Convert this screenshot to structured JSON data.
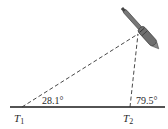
{
  "diagram": {
    "type": "triangulation",
    "ground_line": {
      "x1": 10,
      "x2": 165,
      "y": 107
    },
    "points": [
      {
        "id": "T1",
        "label": "T",
        "subscript": "1",
        "x": 22,
        "y": 107
      },
      {
        "id": "T2",
        "label": "T",
        "subscript": "2",
        "x": 130,
        "y": 107
      },
      {
        "id": "apex",
        "x": 138,
        "y": 34
      }
    ],
    "angles": [
      {
        "at": "T1",
        "value": "28.1°"
      },
      {
        "at": "T2",
        "value": "79.5°"
      }
    ],
    "colors": {
      "line": "#1a1a1a",
      "dashed": "#333333",
      "rocket_body": "#6e6e6e",
      "rocket_dark": "#3a3a3a"
    }
  }
}
